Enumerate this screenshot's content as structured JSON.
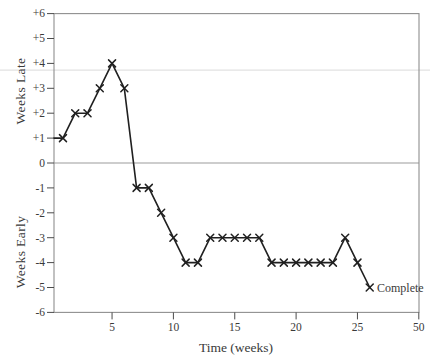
{
  "chart_data": {
    "type": "line",
    "title": "",
    "xlabel": "Time (weeks)",
    "ylabel_upper": "Weeks Late",
    "ylabel_lower": "Weeks Early",
    "annotation": "Complete",
    "marker": "x",
    "line_starts_at_y_axis": true,
    "x": [
      1,
      2,
      3,
      4,
      5,
      6,
      7,
      8,
      9,
      10,
      11,
      12,
      13,
      14,
      15,
      16,
      17,
      18,
      19,
      20,
      21,
      22,
      23,
      24,
      25,
      26
    ],
    "values": [
      1,
      2,
      2,
      3,
      4,
      3,
      -1,
      -1,
      -2,
      -3,
      -4,
      -4,
      -3,
      -3,
      -3,
      -3,
      -3,
      -4,
      -4,
      -4,
      -4,
      -4,
      -4,
      -3,
      -4,
      -5
    ],
    "x_ticks": [
      {
        "week": 5,
        "label": "5"
      },
      {
        "week": 10,
        "label": "10"
      },
      {
        "week": 15,
        "label": "15"
      },
      {
        "week": 20,
        "label": "20"
      },
      {
        "week": 25,
        "label": "25"
      },
      {
        "week": 30,
        "label": "50"
      }
    ],
    "y_ticks": [
      {
        "value": 6,
        "label": "+6"
      },
      {
        "value": 5,
        "label": "+5"
      },
      {
        "value": 4,
        "label": "+4"
      },
      {
        "value": 3,
        "label": "+3"
      },
      {
        "value": 2,
        "label": "+2"
      },
      {
        "value": 1,
        "label": "+1"
      },
      {
        "value": 0,
        "label": "0"
      },
      {
        "value": -1,
        "label": "-1"
      },
      {
        "value": -2,
        "label": "-2"
      },
      {
        "value": -3,
        "label": "-3"
      },
      {
        "value": -4,
        "label": "-4"
      },
      {
        "value": -5,
        "label": "-5"
      },
      {
        "value": -6,
        "label": "-6"
      }
    ],
    "xlim": [
      0.3,
      30
    ],
    "ylim": [
      -6,
      6
    ],
    "zero_line": true,
    "faint_gridline_value": 3.73,
    "legend": null,
    "colors": {
      "background": "#ffffff",
      "line": "#202020",
      "marker": "#202020",
      "plot_border": "#8f8f8f",
      "zero_line": "#9b9b9b",
      "faint_gridline": "#e2e2e2",
      "tick": "#4a4a4a",
      "text": "#3a3a3a"
    }
  }
}
